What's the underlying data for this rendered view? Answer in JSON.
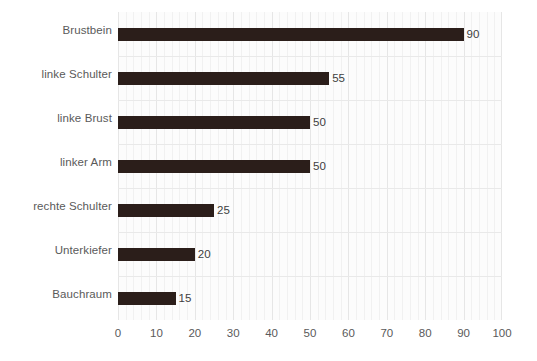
{
  "chart_data": {
    "type": "bar",
    "orientation": "horizontal",
    "title": "",
    "subtitle": "",
    "xlabel": "",
    "ylabel": "",
    "categories": [
      "Brustbein",
      "linke Schulter",
      "linke Brust",
      "linker Arm",
      "rechte Schulter",
      "Unterkiefer",
      "Bauchraum"
    ],
    "values": [
      90,
      55,
      50,
      50,
      25,
      20,
      15
    ],
    "data_labels": [
      "90",
      "55",
      "50",
      "50",
      "25",
      "20",
      "15"
    ],
    "xlim": [
      0,
      100
    ],
    "xticks": [
      0,
      10,
      20,
      30,
      40,
      50,
      60,
      70,
      80,
      90,
      100
    ],
    "xtick_labels": [
      "0",
      "10",
      "20",
      "30",
      "40",
      "50",
      "60",
      "70",
      "80",
      "90",
      "100"
    ],
    "xtick_step": 10,
    "minor_gridline_step": 2,
    "grid": {
      "vertical_major": true,
      "vertical_minor": true,
      "horizontal_category_separators": true
    },
    "legend": {
      "visible": false,
      "position": "none"
    },
    "colors": {
      "bar": "#2b1e1a",
      "plot_background": "#fcfcfc",
      "page_background": "#ffffff",
      "gridline_major": "#e6e6e6",
      "gridline_minor": "#f1f1f1",
      "category_separator": "#e9e9e9",
      "category_label_text": "#5a5a5a",
      "tick_label_text": "#5a5a5a",
      "data_label_text": "#404040"
    }
  }
}
